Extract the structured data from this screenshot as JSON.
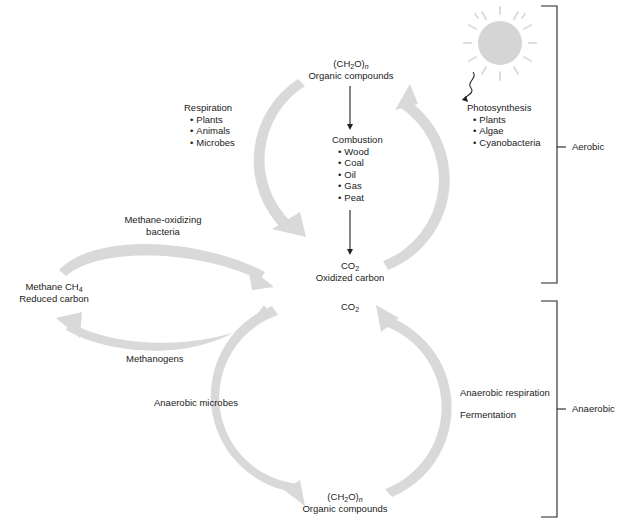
{
  "colors": {
    "arc": "#d9d9d9",
    "sun": "#d5d5d5",
    "sun_rays": "#dcdcdc",
    "line": "#222222",
    "text": "#222222",
    "background": "#ffffff"
  },
  "nodes": {
    "organic_top": {
      "formula_main": "(CH",
      "formula_sub": "2",
      "formula_tail": "O)",
      "formula_n": "n",
      "label": "Organic compounds"
    },
    "co2_aerobic": {
      "formula_main": "CO",
      "formula_sub": "2",
      "label": "Oxidized carbon"
    },
    "co2_anaerobic": {
      "formula_main": "CO",
      "formula_sub": "2"
    },
    "methane": {
      "label_main": "Methane CH",
      "label_sub": "4",
      "label2": "Reduced carbon"
    },
    "organic_bottom": {
      "formula_main": "(CH",
      "formula_sub": "2",
      "formula_tail": "O)",
      "formula_n": "n",
      "label": "Organic compounds"
    }
  },
  "processes": {
    "respiration": {
      "title": "Respiration",
      "items": [
        "Plants",
        "Animals",
        "Microbes"
      ]
    },
    "combustion": {
      "title": "Combustion",
      "items": [
        "Wood",
        "Coal",
        "Oil",
        "Gas",
        "Peat"
      ]
    },
    "photosynthesis": {
      "title": "Photosynthesis",
      "items": [
        "Plants",
        "Algae",
        "Cyanobacteria"
      ]
    },
    "methane_oxidizing": {
      "line1": "Methane-oxidizing",
      "line2": "bacteria"
    },
    "methanogens": {
      "label": "Methanogens"
    },
    "anaerobic_microbes": {
      "label": "Anaerobic microbes"
    },
    "anaerobic_respiration": {
      "label": "Anaerobic respiration"
    },
    "fermentation": {
      "label": "Fermentation"
    }
  },
  "brackets": {
    "aerobic": {
      "label": "Aerobic"
    },
    "anaerobic": {
      "label": "Anaerobic"
    }
  }
}
